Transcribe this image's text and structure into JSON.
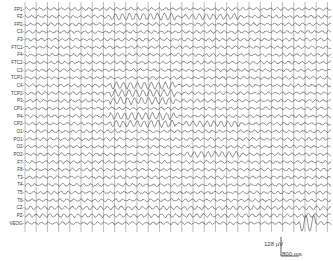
{
  "chart_data": {
    "type": "line",
    "title": "",
    "channels": [
      "FP1",
      "FZ",
      "FP2",
      "C3",
      "F3",
      "FTC1",
      "F4",
      "FTC2",
      "C3",
      "TCP1",
      "C4",
      "TCP2",
      "P3",
      "CP1",
      "P4",
      "CP2",
      "O1",
      "PO1",
      "O2",
      "PO2",
      "F7",
      "F8",
      "T3",
      "T4",
      "T5",
      "T6",
      "CZ",
      "PZ",
      "VEOG"
    ],
    "scale_bar": {
      "amplitude": "128 μV",
      "time": "800 ms"
    },
    "vertical_gridlines": true,
    "annotations": [
      {
        "region": "high-amplitude burst",
        "x_px": [
          110,
          175
        ],
        "channels": [
          "FZ",
          "P4",
          "CP2"
        ]
      },
      {
        "region": "second burst",
        "x_px": [
          185,
          240
        ],
        "channels": [
          "FZ",
          "PO2"
        ]
      },
      {
        "region": "eye artifact",
        "x_px": [
          300,
          315
        ],
        "channels": [
          "VEOG"
        ]
      }
    ]
  },
  "scale": {
    "amp_label": "128 μV",
    "time_label": "800 ms"
  }
}
